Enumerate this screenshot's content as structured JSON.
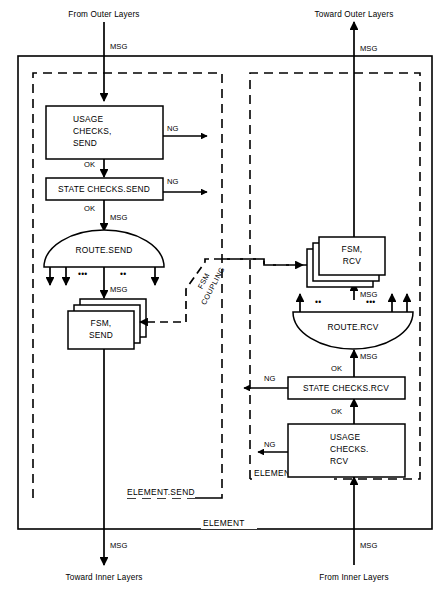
{
  "diagram": {
    "colors": {
      "line": "#000000",
      "background": "#ffffff"
    }
  },
  "external_labels": {
    "top_left": "From Outer Layers",
    "top_right": "Toward Outer Layers",
    "bottom_left": "Toward Inner Layers",
    "bottom_right": "From Inner Layers"
  },
  "frames": {
    "outer": "ELEMENT",
    "send": "ELEMENT.SEND",
    "rcv": "ELEMENT.RCV"
  },
  "coupling": {
    "line1": "FSM",
    "line2": "COUPLING"
  },
  "send_path": {
    "usage_checks": [
      "USAGE",
      "CHECKS,",
      "SEND"
    ],
    "state_checks": "STATE CHECKS.SEND",
    "route": "ROUTE.SEND",
    "fsm": [
      "FSM,",
      "SEND"
    ]
  },
  "rcv_path": {
    "usage_checks": [
      "USAGE",
      "CHECKS.",
      "RCV"
    ],
    "state_checks": "STATE CHECKS.RCV",
    "route": "ROUTE.RCV",
    "fsm": [
      "FSM,",
      "RCV"
    ]
  },
  "edge_labels": {
    "msg": "MSG",
    "ok": "OK",
    "ng": "NG"
  },
  "ellipsis": {
    "two": "••",
    "three": "•••"
  }
}
